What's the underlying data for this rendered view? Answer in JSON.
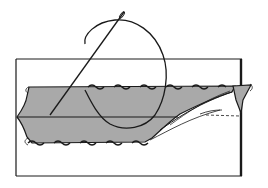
{
  "illustration": {
    "subject": "needle and thread sewing a folded fabric hem",
    "colors": {
      "background": "#ffffff",
      "line": "#1a1a1a",
      "fabric_fill": "#a9a9a9"
    },
    "elements": [
      "paper-sheet",
      "folded-fabric",
      "fold-line",
      "needle",
      "thread",
      "stitches",
      "fabric-fold-corner"
    ]
  }
}
